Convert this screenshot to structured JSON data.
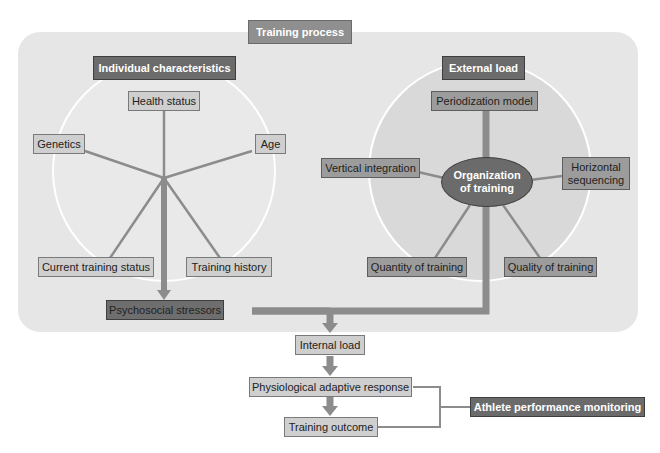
{
  "diagram": {
    "title": "Training process",
    "groups": {
      "individual": {
        "header": "Individual characteristics",
        "items": [
          "Health status",
          "Genetics",
          "Age",
          "Current training status",
          "Training history"
        ]
      },
      "external": {
        "header": "External load",
        "center": "Organization of training",
        "center_lines": [
          "Organization",
          "of training"
        ],
        "items": [
          "Periodization model",
          "Vertical integration",
          "Horizontal sequencing",
          "Quantity of training",
          "Quality of training"
        ],
        "horizontal_lines": [
          "Horizontal",
          "sequencing"
        ]
      }
    },
    "flow": {
      "psychosocial": "Psychosocial stressors",
      "internal_load": "Internal load",
      "physiological": "Physiological adaptive response",
      "outcome": "Training outcome",
      "monitoring": "Athlete performance monitoring"
    },
    "colors": {
      "panel": "#e6e6e6",
      "light_box": "#cfcfcf",
      "mid_box": "#9c9c9c",
      "dark_box": "#6b6b6b",
      "connector": "#8a8a8a"
    }
  }
}
